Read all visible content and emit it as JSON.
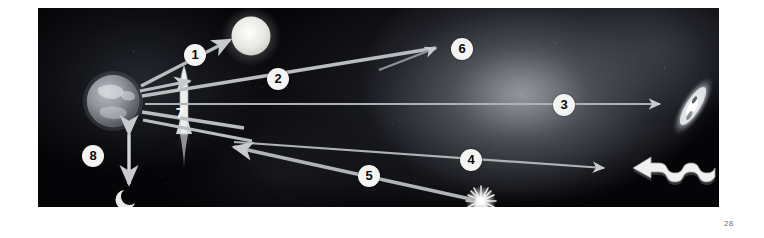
{
  "page": {
    "number": "28",
    "background_color": "#ffffff"
  },
  "figure": {
    "name": "astronomy-messengers-diagram",
    "panel": {
      "background_color": "#050507",
      "x": 38,
      "y": 8,
      "width": 681,
      "height": 199
    },
    "callouts": [
      {
        "id": "1",
        "label": "1",
        "x": 157,
        "y": 47,
        "target": "bright-star-sun",
        "arrow": {
          "x1": 103,
          "y1": 78,
          "x2": 196,
          "y2": 30
        }
      },
      {
        "id": "2",
        "label": "2",
        "x": 240,
        "y": 71,
        "target": "galactic-glow-upper",
        "arrow": {
          "x1": 104,
          "y1": 88,
          "x2": 404,
          "y2": 38
        }
      },
      {
        "id": "3",
        "label": "3",
        "x": 526,
        "y": 97,
        "target": "distant-galaxy",
        "arrow": {
          "x1": 107,
          "y1": 96,
          "x2": 628,
          "y2": 96
        }
      },
      {
        "id": "4",
        "label": "4",
        "x": 433,
        "y": 152,
        "target": "radio-wave-symbol",
        "arrow": {
          "x1": 195,
          "y1": 134,
          "x2": 573,
          "y2": 161
        }
      },
      {
        "id": "5",
        "label": "5",
        "x": 331,
        "y": 168,
        "target": "supernova-burst",
        "arrow": {
          "x1": 437,
          "y1": 192,
          "x2": 190,
          "y2": 138
        }
      },
      {
        "id": "6",
        "label": "6",
        "x": 424,
        "y": 41,
        "target": "bright-nebula-core",
        "arrow": {
          "x1": 341,
          "y1": 62,
          "x2": 404,
          "y2": 38
        }
      },
      {
        "id": "7",
        "label": "7",
        "x": 142,
        "y": 105,
        "target": "rocket-probe",
        "arrow": null
      },
      {
        "id": "8",
        "label": "8",
        "x": 55,
        "y": 148,
        "target": "earth-moon-distance",
        "arrow": {
          "x1": 91,
          "y1": 124,
          "x2": 91,
          "y2": 181
        }
      }
    ],
    "objects": [
      {
        "name": "earth",
        "kind": "planet",
        "x": 75,
        "y": 93,
        "r": 26
      },
      {
        "name": "moon",
        "kind": "crescent-moon",
        "x": 92,
        "y": 190
      },
      {
        "name": "bright-star-sun",
        "kind": "star",
        "x": 213,
        "y": 28,
        "r": 20
      },
      {
        "name": "distant-galaxy",
        "kind": "spiral-galaxy",
        "x": 655,
        "y": 98
      },
      {
        "name": "supernova-burst",
        "kind": "starburst",
        "x": 443,
        "y": 193
      },
      {
        "name": "radio-wave-symbol",
        "kind": "wave-arrow",
        "x": 600,
        "y": 166
      },
      {
        "name": "rocket-probe",
        "kind": "rocket",
        "x": 146,
        "y": 90
      }
    ]
  }
}
